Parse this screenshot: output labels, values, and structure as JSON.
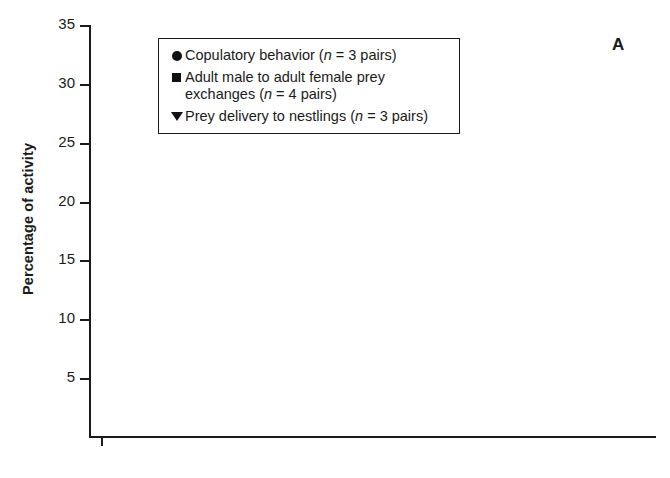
{
  "panel": {
    "letter": "A"
  },
  "axes": {
    "ylabel": "Percentage of activity",
    "xlabel": "",
    "yticks": [
      "5",
      "10",
      "15",
      "20",
      "25",
      "30",
      "35"
    ],
    "xticks": [
      "0600",
      "0800",
      "1000",
      "1200",
      "1400",
      "1600",
      "1800"
    ]
  },
  "legend": {
    "items": [
      {
        "glyph": "filled-circle-icon",
        "text_main": "Copulatory behavior (",
        "text_italic": "n",
        "text_tail": " = 3 pairs)"
      },
      {
        "glyph": "filled-square-icon",
        "text_main": "Adult male to adult female prey exchanges (",
        "text_italic": "n",
        "text_tail": " = 4 pairs)"
      },
      {
        "glyph": "filled-triangle-down-icon",
        "text_main": "Prey delivery to nestlings (",
        "text_italic": "n",
        "text_tail": " = 3 pairs)"
      }
    ]
  },
  "chart_data": {
    "type": "scatter",
    "title": "",
    "xlabel": "",
    "ylabel": "Percentage of activity",
    "xlim": [
      470,
      1870
    ],
    "ylim": [
      0,
      35
    ],
    "ytick_values": [
      5,
      10,
      15,
      20,
      25,
      30,
      35
    ],
    "xtick_values": [
      600,
      800,
      1000,
      1200,
      1400,
      1600,
      1800
    ],
    "xminor_step": 100,
    "grid": false,
    "legend_position": "upper-center",
    "error_bars": "vertical, capped (mean +/- SE)",
    "series": [
      {
        "name": "Copulatory behavior (n = 3 pairs)",
        "marker": "circle",
        "points": [
          {
            "x": 495,
            "y": 10.6,
            "lo": 2.0,
            "hi": 20.2
          },
          {
            "x": 570,
            "y": 18.2,
            "lo": 6.0,
            "hi": 29.7
          },
          {
            "x": 645,
            "y": 7.1,
            "lo": 3.5,
            "hi": 22.9
          },
          {
            "x": 745,
            "y": 10.6,
            "lo": 4.0,
            "hi": 17.2
          },
          {
            "x": 845,
            "y": 3.7,
            "lo": 1.3,
            "hi": 8.9
          },
          {
            "x": 945,
            "y": 3.3,
            "lo": 2.0,
            "hi": 12.3
          },
          {
            "x": 1045,
            "y": 2.9,
            "lo": 1.6,
            "hi": 6.0
          },
          {
            "x": 1145,
            "y": 1.2,
            "lo": 0.5,
            "hi": 3.0
          },
          {
            "x": 1270,
            "y": 0.2,
            "lo": 0.2,
            "hi": 0.2
          },
          {
            "x": 1370,
            "y": 1.3,
            "lo": 0.4,
            "hi": 2.4
          },
          {
            "x": 1460,
            "y": 2.6,
            "lo": 1.0,
            "hi": 4.2
          },
          {
            "x": 1550,
            "y": 17.4,
            "lo": 5.4,
            "hi": 28.8
          },
          {
            "x": 1660,
            "y": 9.0,
            "lo": 3.0,
            "hi": 14.8
          },
          {
            "x": 1775,
            "y": 13.6,
            "lo": 8.9,
            "hi": 17.2
          }
        ]
      },
      {
        "name": "Adult male to adult female prey exchanges (n = 4 pairs)",
        "marker": "square",
        "points": [
          {
            "x": 510,
            "y": 8.0,
            "lo": 3.5,
            "hi": 12.5
          },
          {
            "x": 595,
            "y": 10.0,
            "lo": 6.0,
            "hi": 14.0
          },
          {
            "x": 700,
            "y": 12.3,
            "lo": 9.5,
            "hi": 16.0
          },
          {
            "x": 775,
            "y": 7.9,
            "lo": 4.3,
            "hi": 13.2
          },
          {
            "x": 880,
            "y": 5.8,
            "lo": 2.9,
            "hi": 8.5
          },
          {
            "x": 975,
            "y": 7.9,
            "lo": 5.2,
            "hi": 11.6
          },
          {
            "x": 1070,
            "y": 4.3,
            "lo": 2.6,
            "hi": 7.0
          },
          {
            "x": 1190,
            "y": 5.8,
            "lo": 2.9,
            "hi": 9.6
          },
          {
            "x": 1300,
            "y": 4.7,
            "lo": 2.2,
            "hi": 8.6
          },
          {
            "x": 1395,
            "y": 6.8,
            "lo": 5.0,
            "hi": 9.1
          },
          {
            "x": 1490,
            "y": 10.6,
            "lo": 6.9,
            "hi": 13.8
          },
          {
            "x": 1600,
            "y": 5.3,
            "lo": 2.6,
            "hi": 7.6
          },
          {
            "x": 1690,
            "y": 8.3,
            "lo": 6.0,
            "hi": 10.6
          },
          {
            "x": 1800,
            "y": 3.8,
            "lo": 1.6,
            "hi": 7.1
          }
        ]
      },
      {
        "name": "Prey delivery to nestlings (n = 3 pairs)",
        "marker": "triangle-down",
        "points": [
          {
            "x": 530,
            "y": 5.9,
            "lo": 1.5,
            "hi": 9.8
          },
          {
            "x": 615,
            "y": 9.8,
            "lo": 8.5,
            "hi": 11.1
          },
          {
            "x": 720,
            "y": 14.3,
            "lo": 6.0,
            "hi": 17.0
          },
          {
            "x": 795,
            "y": 7.8,
            "lo": 5.3,
            "hi": 10.6
          },
          {
            "x": 900,
            "y": 7.7,
            "lo": 6.3,
            "hi": 9.2
          },
          {
            "x": 1000,
            "y": 9.2,
            "lo": 6.8,
            "hi": 12.2
          },
          {
            "x": 1090,
            "y": 5.0,
            "lo": 3.8,
            "hi": 7.5
          },
          {
            "x": 1215,
            "y": 4.7,
            "lo": 2.2,
            "hi": 8.0
          },
          {
            "x": 1320,
            "y": 5.1,
            "lo": 3.0,
            "hi": 8.8
          },
          {
            "x": 1410,
            "y": 6.4,
            "lo": 5.0,
            "hi": 7.7
          },
          {
            "x": 1515,
            "y": 8.0,
            "lo": 3.2,
            "hi": 12.3
          },
          {
            "x": 1620,
            "y": 6.7,
            "lo": 4.7,
            "hi": 7.6
          },
          {
            "x": 1710,
            "y": 9.8,
            "lo": 8.4,
            "hi": 11.4
          },
          {
            "x": 1818,
            "y": 2.2,
            "lo": 1.0,
            "hi": 5.2
          }
        ]
      }
    ]
  }
}
